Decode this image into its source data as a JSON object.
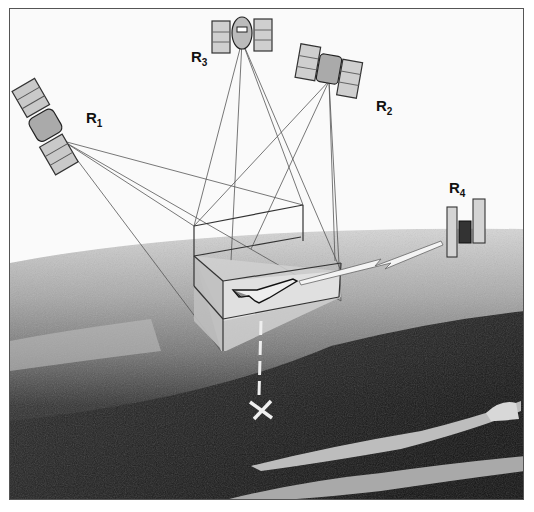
{
  "figure": {
    "labels": [
      {
        "id": "R1",
        "text": "R",
        "sub": "1"
      },
      {
        "id": "R2",
        "text": "R",
        "sub": "2"
      },
      {
        "id": "R3",
        "text": "R",
        "sub": "3"
      },
      {
        "id": "R4",
        "text": "R",
        "sub": "4"
      }
    ],
    "elements": [
      "satellite-R1",
      "satellite-R2",
      "satellite-R3",
      "satellite-R4",
      "space-shuttle",
      "tracking-volume-box",
      "ground-point-marker",
      "communication-link-bolt",
      "earth-surface"
    ],
    "colors": {
      "sky": "#fafafa",
      "earth_light": "#c8c8c8",
      "earth_mid": "#8a8a8a",
      "earth_dark": "#1c1c1c",
      "lines": "#444444"
    }
  }
}
